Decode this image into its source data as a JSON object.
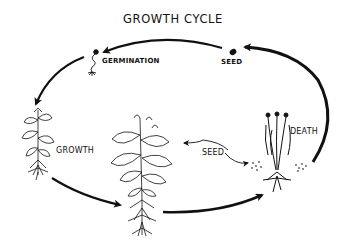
{
  "diagram": {
    "title": "GROWTH CYCLE",
    "stages": [
      {
        "id": "seed-top",
        "label": "SEED"
      },
      {
        "id": "germination",
        "label": "GERMINATION"
      },
      {
        "id": "growth",
        "label": "GROWTH"
      },
      {
        "id": "seed-mature",
        "label": "SEED"
      },
      {
        "id": "death",
        "label": "DEATH"
      }
    ],
    "flow": [
      "SEED",
      "GERMINATION",
      "GROWTH",
      "mature plant",
      "DEATH",
      "SEED"
    ],
    "colors": {
      "ink": "#111111",
      "background": "#ffffff"
    }
  }
}
